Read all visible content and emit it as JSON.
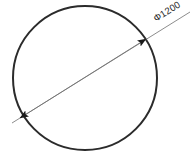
{
  "drawing": {
    "title": "Circle with diameter dimension",
    "background_color": "#ffffff",
    "canvas": {
      "width": 192,
      "height": 158
    },
    "shape": {
      "name": "circle",
      "stroke_color": "#2b2b2b",
      "stroke_width": 2,
      "fill": "none",
      "center_x": 85,
      "center_y": 78,
      "radius": 72
    },
    "dimension": {
      "label": "Φ1200",
      "symbol": "Φ",
      "value": "1200",
      "kind": "diameter",
      "line_color": "#6f6f6f",
      "line_width": 0.8,
      "arrow_color": "#1a1a1a",
      "text_color": "#1a1a1a",
      "text_rotation_deg": -32,
      "leader_start_x": 12,
      "leader_start_y": 123,
      "leader_end_x": 190,
      "leader_end_y": 12,
      "arrow_start_x": 20,
      "arrow_start_y": 118,
      "arrow_end_x": 146,
      "arrow_end_y": 39,
      "text_x": 156,
      "text_y": 22
    }
  }
}
